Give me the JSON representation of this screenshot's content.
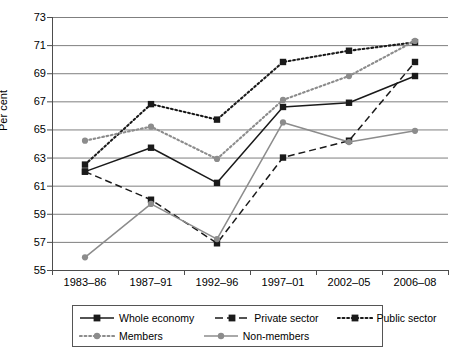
{
  "chart_data": {
    "type": "line",
    "title": "",
    "xlabel": "",
    "ylabel": "Per cent",
    "ylim": [
      55,
      73
    ],
    "ytick_step": 2,
    "yticks": [
      73,
      71,
      69,
      67,
      65,
      63,
      61,
      59,
      57,
      55
    ],
    "grid": true,
    "legend_position": "bottom",
    "categories": [
      "1983–86",
      "1987–91",
      "1992–96",
      "1997–01",
      "2002–05",
      "2006–08"
    ],
    "series": [
      {
        "name": "Whole economy",
        "values": [
          62.0,
          63.7,
          61.2,
          66.6,
          66.9,
          68.8
        ],
        "color": "#1a1a1a",
        "line_style": "solid",
        "marker": "square"
      },
      {
        "name": "Private sector",
        "values": [
          62.0,
          60.0,
          56.9,
          63.0,
          64.2,
          69.8
        ],
        "color": "#1a1a1a",
        "line_style": "dashed",
        "marker": "square"
      },
      {
        "name": "Public sector",
        "values": [
          62.5,
          66.8,
          65.7,
          69.8,
          70.6,
          71.2
        ],
        "color": "#1a1a1a",
        "line_style": "dotted",
        "marker": "square"
      },
      {
        "name": "Members",
        "values": [
          64.2,
          65.2,
          62.9,
          67.1,
          68.8,
          71.3
        ],
        "color": "#8c8c8c",
        "line_style": "dotted",
        "marker": "circle"
      },
      {
        "name": "Non-members",
        "values": [
          55.9,
          59.7,
          57.2,
          65.5,
          64.1,
          64.9
        ],
        "color": "#8c8c8c",
        "line_style": "solid",
        "marker": "circle"
      }
    ]
  },
  "colors": {
    "gridline": "#7f7f7f",
    "axis": "#4d4d4d",
    "background": "#ffffff",
    "dark_series": "#1a1a1a",
    "gray_series": "#8c8c8c",
    "legend_border": "#555555"
  }
}
